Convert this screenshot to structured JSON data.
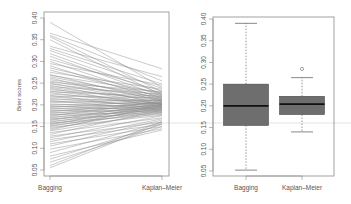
{
  "chart_data": [
    {
      "type": "line",
      "title": "",
      "description": "Paired slope plot of Brier scores per dataset: Bagging vs Kaplan-Meier",
      "xlabel": "",
      "ylabel": "Brier scores",
      "categories": [
        "Bagging",
        "Kaplan–Meier"
      ],
      "ylim": [
        0.05,
        0.4
      ],
      "yticks": [
        0.05,
        0.1,
        0.15,
        0.2,
        0.25,
        0.3,
        0.35,
        0.4
      ],
      "ytick_labels": [
        "0.05",
        "0.10",
        "0.15",
        "0.20",
        "0.25",
        "0.30",
        "0.35",
        "0.40"
      ],
      "grid": false,
      "line_color": "#8c8c8c",
      "pairs": [
        [
          0.39,
          0.24
        ],
        [
          0.365,
          0.283
        ],
        [
          0.36,
          0.255
        ],
        [
          0.357,
          0.23
        ],
        [
          0.35,
          0.222
        ],
        [
          0.335,
          0.265
        ],
        [
          0.33,
          0.248
        ],
        [
          0.325,
          0.238
        ],
        [
          0.318,
          0.226
        ],
        [
          0.312,
          0.22
        ],
        [
          0.305,
          0.232
        ],
        [
          0.3,
          0.215
        ],
        [
          0.295,
          0.245
        ],
        [
          0.29,
          0.21
        ],
        [
          0.285,
          0.225
        ],
        [
          0.28,
          0.218
        ],
        [
          0.275,
          0.236
        ],
        [
          0.27,
          0.208
        ],
        [
          0.268,
          0.228
        ],
        [
          0.265,
          0.215
        ],
        [
          0.262,
          0.2
        ],
        [
          0.258,
          0.222
        ],
        [
          0.255,
          0.212
        ],
        [
          0.252,
          0.23
        ],
        [
          0.25,
          0.205
        ],
        [
          0.248,
          0.218
        ],
        [
          0.245,
          0.2
        ],
        [
          0.242,
          0.225
        ],
        [
          0.24,
          0.21
        ],
        [
          0.238,
          0.195
        ],
        [
          0.235,
          0.214
        ],
        [
          0.232,
          0.202
        ],
        [
          0.23,
          0.22
        ],
        [
          0.228,
          0.198
        ],
        [
          0.225,
          0.208
        ],
        [
          0.222,
          0.19
        ],
        [
          0.22,
          0.216
        ],
        [
          0.218,
          0.204
        ],
        [
          0.215,
          0.196
        ],
        [
          0.212,
          0.21
        ],
        [
          0.21,
          0.188
        ],
        [
          0.208,
          0.202
        ],
        [
          0.205,
          0.212
        ],
        [
          0.202,
          0.194
        ],
        [
          0.2,
          0.205
        ],
        [
          0.198,
          0.186
        ],
        [
          0.196,
          0.2
        ],
        [
          0.194,
          0.21
        ],
        [
          0.192,
          0.192
        ],
        [
          0.19,
          0.204
        ],
        [
          0.188,
          0.184
        ],
        [
          0.186,
          0.198
        ],
        [
          0.184,
          0.206
        ],
        [
          0.182,
          0.19
        ],
        [
          0.18,
          0.2
        ],
        [
          0.178,
          0.182
        ],
        [
          0.176,
          0.196
        ],
        [
          0.174,
          0.208
        ],
        [
          0.172,
          0.188
        ],
        [
          0.17,
          0.198
        ],
        [
          0.168,
          0.18
        ],
        [
          0.166,
          0.194
        ],
        [
          0.164,
          0.204
        ],
        [
          0.162,
          0.186
        ],
        [
          0.16,
          0.196
        ],
        [
          0.158,
          0.178
        ],
        [
          0.156,
          0.192
        ],
        [
          0.154,
          0.202
        ],
        [
          0.152,
          0.184
        ],
        [
          0.15,
          0.194
        ],
        [
          0.148,
          0.176
        ],
        [
          0.145,
          0.19
        ],
        [
          0.142,
          0.2
        ],
        [
          0.14,
          0.182
        ],
        [
          0.136,
          0.17
        ],
        [
          0.132,
          0.188
        ],
        [
          0.128,
          0.16
        ],
        [
          0.124,
          0.175
        ],
        [
          0.12,
          0.155
        ],
        [
          0.115,
          0.168
        ],
        [
          0.11,
          0.15
        ],
        [
          0.105,
          0.165
        ],
        [
          0.098,
          0.145
        ],
        [
          0.09,
          0.16
        ],
        [
          0.082,
          0.142
        ],
        [
          0.075,
          0.155
        ],
        [
          0.068,
          0.15
        ],
        [
          0.06,
          0.162
        ],
        [
          0.055,
          0.158
        ]
      ]
    },
    {
      "type": "boxplot",
      "title": "",
      "xlabel": "",
      "ylabel": "",
      "categories": [
        "Bagging",
        "Kaplan–Meier"
      ],
      "ylim": [
        0.05,
        0.4
      ],
      "yticks": [
        0.05,
        0.1,
        0.15,
        0.2,
        0.25,
        0.3,
        0.35,
        0.4
      ],
      "ytick_labels": [
        "0.05",
        "0.10",
        "0.15",
        "0.20",
        "0.25",
        "0.30",
        "0.35",
        "0.40"
      ],
      "grid": false,
      "box_fill": "#6e6e6e",
      "boxes": [
        {
          "name": "Bagging",
          "whisker_low": 0.052,
          "q1": 0.155,
          "median": 0.2,
          "q3": 0.25,
          "whisker_high": 0.39,
          "outliers": []
        },
        {
          "name": "Kaplan–Meier",
          "whisker_low": 0.14,
          "q1": 0.18,
          "median": 0.204,
          "q3": 0.222,
          "whisker_high": 0.265,
          "outliers": [
            0.285
          ]
        }
      ]
    }
  ],
  "labels": {
    "ylabel": "Brier scores",
    "cat_left": "Bagging",
    "cat_right": "Kaplan–Meier"
  }
}
